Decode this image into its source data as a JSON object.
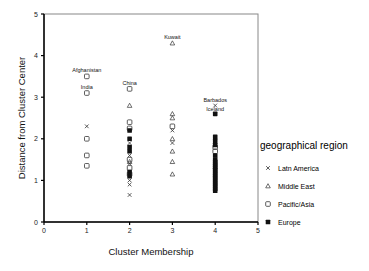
{
  "chart_data": {
    "type": "scatter",
    "title": "",
    "xlabel": "Cluster Membership",
    "ylabel": "Distance from Cluster Center",
    "xlim": [
      0,
      5
    ],
    "ylim": [
      0,
      5
    ],
    "x_ticks": [
      "0",
      "1",
      "2",
      "3",
      "4",
      "5"
    ],
    "y_ticks": [
      "0",
      "1",
      "2",
      "3",
      "4",
      "5"
    ],
    "grid": false,
    "legend_position": "right",
    "legend_title": "geographical region",
    "series": [
      {
        "name": "Latn America",
        "marker": "x",
        "points": [
          {
            "x": 1,
            "y": 2.3
          },
          {
            "x": 2,
            "y": 1.9
          },
          {
            "x": 2,
            "y": 1.6
          },
          {
            "x": 2,
            "y": 1.4
          },
          {
            "x": 2,
            "y": 1.0
          },
          {
            "x": 2,
            "y": 0.9
          },
          {
            "x": 2,
            "y": 0.65
          },
          {
            "x": 3,
            "y": 2.2
          },
          {
            "x": 3,
            "y": 1.9
          },
          {
            "x": 4,
            "y": 2.8,
            "label": "Barbados"
          }
        ]
      },
      {
        "name": "Middle East",
        "marker": "triangle-open",
        "points": [
          {
            "x": 2,
            "y": 2.8
          },
          {
            "x": 2,
            "y": 1.45
          },
          {
            "x": 3,
            "y": 4.3,
            "label": "Kuwait"
          },
          {
            "x": 3,
            "y": 2.6
          },
          {
            "x": 3,
            "y": 2.5
          },
          {
            "x": 3,
            "y": 2.0
          },
          {
            "x": 3,
            "y": 1.7
          },
          {
            "x": 3,
            "y": 1.45
          },
          {
            "x": 3,
            "y": 1.15
          }
        ]
      },
      {
        "name": "Pacific/Asia",
        "marker": "circle-open",
        "points": [
          {
            "x": 1,
            "y": 3.5,
            "label": "Afghanistan"
          },
          {
            "x": 1,
            "y": 3.1,
            "label": "India"
          },
          {
            "x": 1,
            "y": 2.0
          },
          {
            "x": 1,
            "y": 1.6
          },
          {
            "x": 1,
            "y": 1.35
          },
          {
            "x": 2,
            "y": 3.2,
            "label": "China"
          },
          {
            "x": 2,
            "y": 2.4
          },
          {
            "x": 2,
            "y": 2.25
          },
          {
            "x": 2,
            "y": 1.5
          },
          {
            "x": 2,
            "y": 1.3
          },
          {
            "x": 2,
            "y": 1.15
          },
          {
            "x": 3,
            "y": 2.3
          },
          {
            "x": 4,
            "y": 1.8
          },
          {
            "x": 4,
            "y": 1.7
          }
        ]
      },
      {
        "name": "Europe",
        "marker": "square-filled",
        "points": [
          {
            "x": 2,
            "y": 2.2
          },
          {
            "x": 2,
            "y": 2.0
          },
          {
            "x": 2,
            "y": 1.8
          },
          {
            "x": 2,
            "y": 1.7
          },
          {
            "x": 2,
            "y": 1.2
          },
          {
            "x": 2,
            "y": 1.1
          },
          {
            "x": 4,
            "y": 2.6,
            "label": "Iceland"
          },
          {
            "x": 4,
            "y": 2.05
          },
          {
            "x": 4,
            "y": 1.95
          },
          {
            "x": 4,
            "y": 1.85
          },
          {
            "x": 4,
            "y": 1.6
          },
          {
            "x": 4,
            "y": 1.5
          },
          {
            "x": 4,
            "y": 1.45
          },
          {
            "x": 4,
            "y": 1.4
          },
          {
            "x": 4,
            "y": 1.35
          },
          {
            "x": 4,
            "y": 1.3
          },
          {
            "x": 4,
            "y": 1.25
          },
          {
            "x": 4,
            "y": 1.2
          },
          {
            "x": 4,
            "y": 1.15
          },
          {
            "x": 4,
            "y": 1.1
          },
          {
            "x": 4,
            "y": 1.05
          },
          {
            "x": 4,
            "y": 1.0
          },
          {
            "x": 4,
            "y": 0.95
          },
          {
            "x": 4,
            "y": 0.9
          },
          {
            "x": 4,
            "y": 0.85
          },
          {
            "x": 4,
            "y": 0.8
          },
          {
            "x": 4,
            "y": 0.75
          }
        ]
      }
    ]
  },
  "legend": {
    "title": "geographical region",
    "items": [
      {
        "label": "Latn America",
        "marker": "x"
      },
      {
        "label": "Middle East",
        "marker": "triangle-open"
      },
      {
        "label": "Pacific/Asia",
        "marker": "circle-open"
      },
      {
        "label": "Europe",
        "marker": "square-filled"
      }
    ]
  },
  "axes": {
    "xlabel": "Cluster Membership",
    "ylabel": "Distance from Cluster Center"
  }
}
